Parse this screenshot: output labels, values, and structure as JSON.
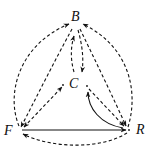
{
  "diagram": {
    "nodes": [
      {
        "id": "B",
        "label": "B"
      },
      {
        "id": "C",
        "label": "C"
      },
      {
        "id": "F",
        "label": "F"
      },
      {
        "id": "R",
        "label": "R"
      }
    ],
    "edges": [
      {
        "from": "F",
        "to": "B",
        "style": "dashed",
        "shape": "outer-arc-left"
      },
      {
        "from": "B",
        "to": "F",
        "style": "dashed",
        "shape": "inner-line"
      },
      {
        "from": "C",
        "to": "B",
        "style": "dashed",
        "shape": "curve"
      },
      {
        "from": "B",
        "to": "C",
        "style": "dashed",
        "shape": "line"
      },
      {
        "from": "F",
        "to": "C",
        "style": "dashed",
        "shape": "line",
        "bidirectional": true
      },
      {
        "from": "R",
        "to": "B",
        "style": "dashed",
        "shape": "outer-arc-right"
      },
      {
        "from": "B",
        "to": "R",
        "style": "dashed",
        "shape": "inner-line"
      },
      {
        "from": "C",
        "to": "R",
        "style": "dashed",
        "shape": "line"
      },
      {
        "from": "R",
        "to": "C",
        "style": "solid",
        "shape": "curve"
      },
      {
        "from": "F",
        "to": "R",
        "style": "solid",
        "shape": "line"
      },
      {
        "from": "R",
        "to": "F",
        "style": "dashed",
        "shape": "bottom-arc"
      }
    ],
    "colors": {
      "ink": "#111111",
      "background": "#ffffff"
    }
  }
}
